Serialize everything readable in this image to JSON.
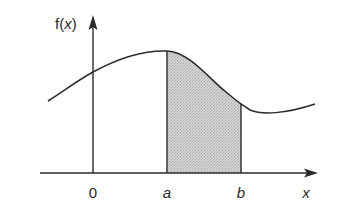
{
  "diagram": {
    "type": "definite-integral-area",
    "y_axis_label": "f(x)",
    "y_axis_label_parts": {
      "fn": "f(",
      "var": "x",
      "close": ")"
    },
    "x_axis_label": "x",
    "origin_label": "0",
    "lower_bound_label": "a",
    "upper_bound_label": "b",
    "shaded_region": "area under f(x) between a and b",
    "colors": {
      "stroke": "#2a2a2a",
      "shade": "#cfcfcf",
      "background": "#ffffff"
    }
  }
}
